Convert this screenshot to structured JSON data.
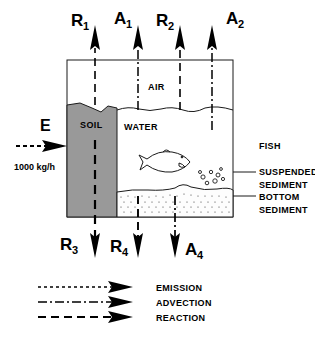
{
  "figure": {
    "title_hidden": "",
    "background_color": "#ffffff",
    "ink_color": "#000000",
    "soil_fill": "#999999",
    "sediment_fill": "#fdfdfd"
  },
  "top_fluxes": [
    {
      "name": "R1",
      "base": "R",
      "sub": "1",
      "line_style": "reaction",
      "label_side": "left"
    },
    {
      "name": "A1",
      "base": "A",
      "sub": "1",
      "line_style": "advection",
      "label_side": "left"
    },
    {
      "name": "R2",
      "base": "R",
      "sub": "2",
      "line_style": "reaction",
      "label_side": "left"
    },
    {
      "name": "A2",
      "base": "A",
      "sub": "2",
      "line_style": "advection",
      "label_side": "right"
    }
  ],
  "bottom_fluxes": [
    {
      "name": "R3",
      "base": "R",
      "sub": "3",
      "line_style": "reaction",
      "label_side": "left"
    },
    {
      "name": "R4",
      "base": "R",
      "sub": "4",
      "line_style": "reaction",
      "label_side": "left"
    },
    {
      "name": "A4",
      "base": "A",
      "sub": "4",
      "line_style": "advection",
      "label_side": "right"
    }
  ],
  "emission": {
    "symbol": "E",
    "rate": "1000 kg/h",
    "line_style": "emission"
  },
  "compartments": {
    "air": "AIR",
    "soil": "SOIL",
    "water": "WATER"
  },
  "side_labels": [
    {
      "name": "fish",
      "line1": "FISH",
      "line2": ""
    },
    {
      "name": "suspended-sediment",
      "line1": "SUSPENDED",
      "line2": "SEDIMENT"
    },
    {
      "name": "bottom-sediment",
      "line1": "BOTTOM",
      "line2": "SEDIMENT"
    }
  ],
  "legend": [
    {
      "key": "emission",
      "label": "EMISSION",
      "dash": "3,3"
    },
    {
      "key": "advection",
      "label": "ADVECTION",
      "dash": "9,3,2,3"
    },
    {
      "key": "reaction",
      "label": "REACTION",
      "dash": "8,5"
    }
  ]
}
